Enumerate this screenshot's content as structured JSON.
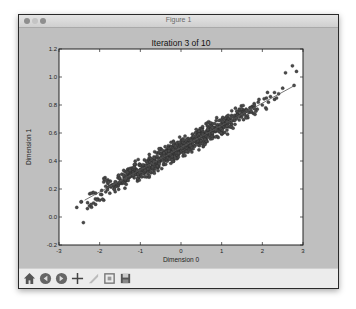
{
  "window": {
    "title": "Figure 1"
  },
  "toolbar": {
    "buttons": [
      {
        "name": "home",
        "icon": "home-icon"
      },
      {
        "name": "back",
        "icon": "back-arrow-icon"
      },
      {
        "name": "forward",
        "icon": "forward-arrow-icon"
      },
      {
        "name": "pan",
        "icon": "move-crosshair-icon"
      },
      {
        "name": "zoom",
        "icon": "zoom-rect-icon"
      },
      {
        "name": "subplots",
        "icon": "subplots-config-icon"
      },
      {
        "name": "save",
        "icon": "save-floppy-icon"
      }
    ]
  },
  "chart_data": {
    "type": "scatter",
    "title": "Iteration 3 of 10",
    "xlabel": "Dimension 0",
    "ylabel": "Dimension 1",
    "xlim": [
      -3,
      3
    ],
    "ylim": [
      -0.2,
      1.2
    ],
    "xticks": [
      -3,
      -2,
      -1,
      0,
      1,
      2,
      3
    ],
    "xtick_labels": [
      "-3",
      "-2",
      "-1",
      "0",
      "1",
      "2",
      "3"
    ],
    "yticks": [
      -0.2,
      0.0,
      0.2,
      0.4,
      0.6,
      0.8,
      1.0,
      1.2
    ],
    "ytick_labels": [
      "-0.2",
      "0.0",
      "0.2",
      "0.4",
      "0.6",
      "0.8",
      "1.0",
      "1.2"
    ],
    "grid": false,
    "legend": null,
    "point_color": "#4a4a4a",
    "line_color": "#555555",
    "fit_line": {
      "x": [
        -2.37,
        2.8
      ],
      "y": [
        0.12,
        0.94
      ]
    },
    "points": {
      "x": [
        -2.4,
        -2.3,
        -2.25,
        -2.2,
        -2.15,
        -2.1,
        -2.05,
        -2.0,
        -1.95,
        -1.9,
        -1.85,
        -1.8,
        -1.75,
        -1.7,
        -1.65,
        -1.6,
        -1.55,
        -1.5,
        -1.45,
        -1.4,
        -1.35,
        -1.3,
        -1.25,
        -1.2,
        -1.15,
        -1.1,
        -1.05,
        -1.0,
        -0.95,
        -0.9,
        -0.85,
        -0.8,
        -0.75,
        -0.7,
        -0.65,
        -0.6,
        -0.55,
        -0.5,
        -0.45,
        -0.4,
        -0.35,
        -0.3,
        -0.25,
        -0.2,
        -0.15,
        -0.1,
        -0.05,
        0.0,
        0.05,
        0.1,
        0.15,
        0.2,
        0.25,
        0.3,
        0.35,
        0.4,
        0.45,
        0.5,
        0.55,
        0.6,
        0.65,
        0.7,
        0.75,
        0.8,
        0.85,
        0.9,
        0.95,
        1.0,
        1.05,
        1.1,
        1.15,
        1.2,
        1.25,
        1.3,
        1.35,
        1.4,
        1.45,
        1.5,
        1.55,
        1.6,
        1.65,
        1.7,
        1.75,
        1.8,
        1.9,
        2.0,
        2.1,
        2.2,
        2.3,
        2.4,
        2.5,
        2.57,
        2.74,
        2.84,
        2.78,
        -1.8,
        -1.6,
        -1.4,
        -1.2,
        -1.0,
        -0.8,
        -0.6,
        -0.4,
        -0.2,
        0.0,
        0.2,
        0.4,
        0.6,
        0.8,
        1.0,
        1.2,
        1.4,
        1.6,
        1.8,
        -1.5,
        -1.1,
        -0.7,
        -0.3,
        0.1,
        0.5,
        0.9,
        1.3,
        1.7,
        -0.9,
        -0.5,
        -0.1,
        0.3,
        0.7,
        1.1,
        -2.1,
        -1.95,
        2.15,
        2.35,
        -0.65,
        0.45,
        1.45,
        -1.35,
        0.15,
        0.85
      ],
      "y": [
        -0.04,
        0.06,
        0.08,
        0.07,
        0.1,
        0.09,
        0.13,
        0.12,
        0.16,
        0.12,
        0.18,
        0.21,
        0.17,
        0.23,
        0.2,
        0.25,
        0.22,
        0.27,
        0.24,
        0.28,
        0.26,
        0.3,
        0.29,
        0.31,
        0.28,
        0.33,
        0.32,
        0.34,
        0.36,
        0.33,
        0.37,
        0.36,
        0.39,
        0.37,
        0.4,
        0.39,
        0.42,
        0.4,
        0.43,
        0.41,
        0.45,
        0.44,
        0.46,
        0.45,
        0.48,
        0.46,
        0.49,
        0.5,
        0.48,
        0.52,
        0.51,
        0.53,
        0.52,
        0.55,
        0.54,
        0.57,
        0.55,
        0.58,
        0.57,
        0.6,
        0.59,
        0.61,
        0.6,
        0.63,
        0.62,
        0.65,
        0.64,
        0.66,
        0.65,
        0.68,
        0.67,
        0.7,
        0.69,
        0.71,
        0.72,
        0.73,
        0.72,
        0.75,
        0.74,
        0.77,
        0.76,
        0.78,
        0.79,
        0.81,
        0.82,
        0.8,
        0.85,
        0.86,
        0.84,
        0.88,
        0.92,
        1.03,
        1.08,
        1.04,
        0.94,
        0.24,
        0.22,
        0.3,
        0.35,
        0.37,
        0.41,
        0.37,
        0.47,
        0.43,
        0.52,
        0.49,
        0.59,
        0.53,
        0.64,
        0.63,
        0.69,
        0.74,
        0.71,
        0.79,
        0.25,
        0.34,
        0.35,
        0.47,
        0.5,
        0.55,
        0.66,
        0.69,
        0.78,
        0.31,
        0.45,
        0.43,
        0.57,
        0.58,
        0.7,
        0.17,
        0.19,
        0.82,
        0.85,
        0.42,
        0.53,
        0.76,
        0.26,
        0.49,
        0.61
      ]
    }
  }
}
